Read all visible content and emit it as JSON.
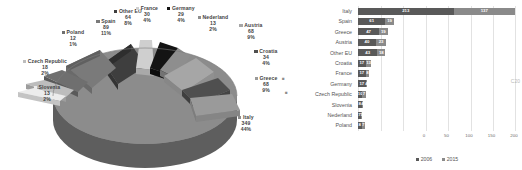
{
  "chart_data": [
    {
      "type": "pie",
      "title": "",
      "legend_position": "labels",
      "unit_note": "values with percentage of total",
      "labels": [
        "Other EU",
        "France",
        "Germany",
        "Nederland",
        "Austria",
        "Croatia",
        "Greece",
        "Italy",
        "Slovenia",
        "Czech Republic",
        "Poland",
        "Spain"
      ],
      "values": [
        64,
        30,
        29,
        13,
        68,
        34,
        68,
        349,
        13,
        18,
        12,
        89
      ],
      "percentages": [
        "8%",
        "4%",
        "4%",
        "2%",
        "9%",
        "4%",
        "9%",
        "44%",
        "2%",
        "2%",
        "1%",
        "11%"
      ],
      "slices": [
        {
          "label": "Other EU",
          "value": 64,
          "percent": "8%",
          "color": "#5f5f5f"
        },
        {
          "label": "France",
          "value": 30,
          "percent": "4%",
          "color": "#c9c9c9"
        },
        {
          "label": "Germany",
          "value": 29,
          "percent": "4%",
          "color": "#1c1c1c"
        },
        {
          "label": "Nederland",
          "value": 13,
          "percent": "2%",
          "color": "#8f8f8f"
        },
        {
          "label": "Austria",
          "value": 68,
          "percent": "9%",
          "color": "#a8a8a8"
        },
        {
          "label": "Croatia",
          "value": 34,
          "percent": "4%",
          "color": "#4d4d4d"
        },
        {
          "label": "Greece",
          "value": 68,
          "percent": "9%",
          "color": "#9a9a9a"
        },
        {
          "label": "Italy",
          "value": 349,
          "percent": "44%",
          "color": "#8c8c8c"
        },
        {
          "label": "Slovenia",
          "value": 13,
          "percent": "2%",
          "color": "#d8d8d8"
        },
        {
          "label": "Czech Republic",
          "value": 18,
          "percent": "2%",
          "color": "#b5b5b5"
        },
        {
          "label": "Poland",
          "value": 12,
          "percent": "1%",
          "color": "#707070"
        },
        {
          "label": "Spain",
          "value": 89,
          "percent": "11%",
          "color": "#777777"
        }
      ]
    },
    {
      "type": "bar",
      "orientation": "horizontal",
      "title": "",
      "xlabel": "",
      "ylabel": "",
      "xlim": [
        0,
        350
      ],
      "xticks": [
        0,
        50,
        100,
        150,
        200,
        250,
        300,
        350
      ],
      "grid": true,
      "legend_position": "bottom",
      "categories": [
        "Italy",
        "Spain",
        "Greece",
        "Austria",
        "Other EU",
        "Croatia",
        "France",
        "Germany",
        "Czech Republic",
        "Slovenia",
        "Nederland",
        "Poland"
      ],
      "series": [
        {
          "name": "2006",
          "color": "#595959",
          "values": [
            213,
            61,
            47,
            40,
            43,
            17,
            17,
            17,
            10,
            8,
            7,
            8
          ]
        },
        {
          "name": "2015",
          "color": "#8a8a8a",
          "values": [
            137,
            19,
            19,
            23,
            18,
            13,
            8,
            4,
            7,
            4,
            1,
            7
          ]
        }
      ]
    }
  ],
  "pie": {
    "labels": [
      {
        "name": "Other EU",
        "value": "64",
        "percent": "8%"
      },
      {
        "name": "France",
        "value": "30",
        "percent": "4%"
      },
      {
        "name": "Germany",
        "value": "29",
        "percent": "4%"
      },
      {
        "name": "Nederland",
        "value": "13",
        "percent": "2%"
      },
      {
        "name": "Austria",
        "value": "68",
        "percent": "9%"
      },
      {
        "name": "Croatia",
        "value": "34",
        "percent": "4%"
      },
      {
        "name": "Greece",
        "value": "68",
        "percent": "9%"
      },
      {
        "name": "Italy",
        "value": "349",
        "percent": "44%"
      },
      {
        "name": "Slovenia",
        "value": "13",
        "percent": "2%"
      },
      {
        "name": "Czech Republic",
        "value": "18",
        "percent": "2%"
      },
      {
        "name": "Poland",
        "value": "12",
        "percent": "1%"
      },
      {
        "name": "Spain",
        "value": "89",
        "percent": "11%"
      }
    ]
  },
  "bar": {
    "categories": [
      "Italy",
      "Spain",
      "Greece",
      "Austria",
      "Other EU",
      "Croatia",
      "France",
      "Germany",
      "Czech Republic",
      "Slovenia",
      "Nederland",
      "Poland"
    ],
    "xticks": [
      "0",
      "50",
      "100",
      "150",
      "200",
      "250",
      "300",
      "350"
    ],
    "legend": [
      {
        "label": "2006",
        "color": "#595959"
      },
      {
        "label": "2015",
        "color": "#8a8a8a"
      }
    ],
    "labels_2006": [
      "213",
      "61",
      "47",
      "40",
      "43",
      "17",
      "17",
      "17",
      "10",
      "8",
      "7",
      "8"
    ],
    "labels_2015": [
      "137",
      "19",
      "19",
      "23",
      "18",
      "13",
      "8",
      "4",
      "7",
      "4",
      "1",
      "7"
    ]
  },
  "watermark": "C20"
}
